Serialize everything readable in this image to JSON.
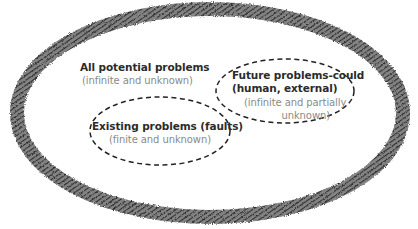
{
  "diagram": {
    "type": "nested-sets",
    "outer_set": {
      "title": "All potential problems",
      "subtitle": "(infinite and unknown)",
      "style": "thick-hatched-border",
      "border_color": "#3a3a3a"
    },
    "inner_sets": [
      {
        "id": "existing",
        "title": "Existing problems (faults)",
        "subtitle": "(finite and unknown)",
        "style": "dashed-border"
      },
      {
        "id": "future",
        "title_line1": "Future problems-could",
        "title_line2": "(human, external)",
        "subtitle_line1": "(infinite and partially",
        "subtitle_line2": "unknown)",
        "style": "dashed-border"
      }
    ],
    "colors": {
      "title_text": "#2b2b2b",
      "subtitle_text": "#8a8a8a",
      "dash_stroke": "#222222",
      "background": "#ffffff"
    }
  }
}
